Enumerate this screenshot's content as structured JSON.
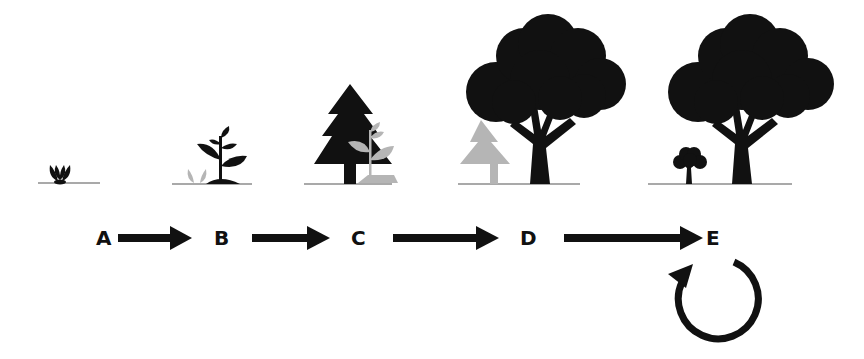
{
  "diagram": {
    "type": "forest-succession",
    "stages": [
      {
        "label": "A",
        "depicts": "seedling sprout"
      },
      {
        "label": "B",
        "depicts": "young leafy plant with faded sprout"
      },
      {
        "label": "C",
        "depicts": "conifer tree with faded plant"
      },
      {
        "label": "D",
        "depicts": "large broadleaf tree with faded conifer"
      },
      {
        "label": "E",
        "depicts": "large broadleaf tree with small broadleaf sapling"
      }
    ],
    "arrows": [
      {
        "from": "A",
        "to": "B"
      },
      {
        "from": "B",
        "to": "C"
      },
      {
        "from": "C",
        "to": "D"
      },
      {
        "from": "D",
        "to": "E"
      }
    ],
    "cycle": {
      "at": "E",
      "icon": "circular-arrow"
    },
    "colors": {
      "dark": "#111111",
      "faded": "#b5b5b5",
      "ground": "#555555"
    }
  }
}
